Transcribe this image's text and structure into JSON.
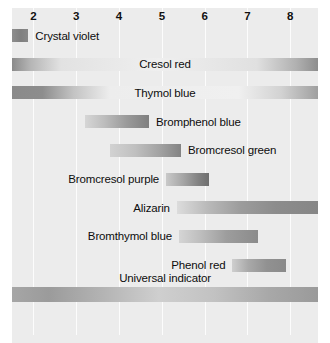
{
  "chart_data": {
    "type": "bar",
    "orientation": "horizontal",
    "title": "",
    "xlabel": "",
    "ylabel": "",
    "xlim": [
      1.5,
      8.65
    ],
    "grid": true,
    "legend": false,
    "axis": {
      "ticks": [
        {
          "label": "2",
          "value": 2
        },
        {
          "label": "3",
          "value": 3
        },
        {
          "label": "4",
          "value": 4
        },
        {
          "label": "5",
          "value": 5
        },
        {
          "label": "6",
          "value": 6
        },
        {
          "label": "7",
          "value": 7
        },
        {
          "label": "8",
          "value": 8
        }
      ]
    },
    "categories": [
      "Crystal violet",
      "Cresol red",
      "Thymol blue",
      "Bromphenol blue",
      "Bromcresol green",
      "Bromcresol purple",
      "Alizarin",
      "Bromthymol blue",
      "Phenol red",
      "Universal indicator"
    ],
    "bars": [
      {
        "label": "Crystal violet",
        "start": 1.5,
        "end": 1.88,
        "label_position": "right",
        "gradient": "linear-gradient(90deg,#8e8e8e 0%,#7f7f7f 55%,#888888 100%)",
        "thick": false
      },
      {
        "label": "Cresol red",
        "start": 1.5,
        "end": 8.65,
        "label_position": "center",
        "gradient": "linear-gradient(90deg,#8a8a8a 0%,#b5b5b5 6%,#e2e2e2 16%,#efefef 48%,#e0e0e0 80%,#b0b0b0 93%,#8d8d8d 100%)",
        "thick": false
      },
      {
        "label": "Thymol blue",
        "start": 1.5,
        "end": 8.65,
        "label_position": "center",
        "gradient": "linear-gradient(90deg,#8a8a8a 0%,#8d8d8d 10%,#c3c3c3 20%,#ededed 32%,#f0f0f0 74%,#d2d2d2 88%,#9f9f9f 100%)",
        "thick": false
      },
      {
        "label": "Bromphenol blue",
        "start": 3.2,
        "end": 4.7,
        "label_position": "right",
        "gradient": "linear-gradient(90deg,#d6d6d6 0%,#bdbdbd 30%,#9a9a9a 65%,#7f7f7f 100%)",
        "thick": false
      },
      {
        "label": "Bromcresol green",
        "start": 3.8,
        "end": 5.45,
        "label_position": "right",
        "gradient": "linear-gradient(90deg,#d2d2d2 0%,#c0c0c0 35%,#a2a2a2 70%,#838383 100%)",
        "thick": false
      },
      {
        "label": "Bromcresol purple",
        "start": 5.1,
        "end": 6.1,
        "label_position": "left",
        "gradient": "linear-gradient(90deg,#c9c9c9 0%,#a5a5a5 40%,#828282 75%,#6f6f6f 100%)",
        "thick": false
      },
      {
        "label": "Alizarin",
        "start": 5.35,
        "end": 8.65,
        "label_position": "left",
        "gradient": "linear-gradient(90deg,#dcdcdc 0%,#b9b9b9 22%,#9c9c9c 45%,#8c8c8c 70%,#868686 100%)",
        "thick": false
      },
      {
        "label": "Bromthymol blue",
        "start": 5.4,
        "end": 7.25,
        "label_position": "left",
        "gradient": "linear-gradient(90deg,#d5d5d5 0%,#bdbdbd 28%,#9d9d9d 60%,#8b8b8b 100%)",
        "thick": false
      },
      {
        "label": "Phenol red",
        "start": 6.65,
        "end": 7.9,
        "label_position": "left",
        "gradient": "linear-gradient(90deg,#cfcfcf 0%,#a9a9a9 30%,#919191 65%,#8a8a8a 100%)",
        "thick": false
      },
      {
        "label": "Universal indicator",
        "start": 1.5,
        "end": 8.65,
        "label_position": "center-above",
        "gradient": "linear-gradient(90deg,#a6a6a6 0%,#9b9b9b 12%,#b4b4b4 30%,#cfcfcf 48%,#c2c2c2 66%,#a8a8a8 84%,#9a9a9a 100%)",
        "thick": true
      }
    ]
  },
  "colors": {
    "panel_background": "#ececec",
    "page_background": "#ffffff",
    "gridline": "#fdfdfd",
    "text": "#0d0d0d"
  }
}
